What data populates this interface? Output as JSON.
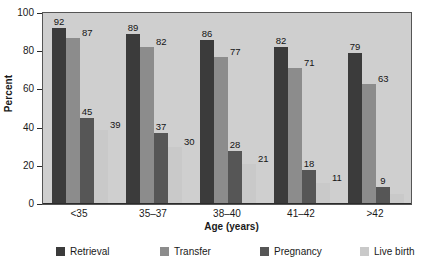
{
  "chart_data": {
    "type": "bar",
    "title": "",
    "xlabel": "Age (years)",
    "ylabel": "Percent",
    "categories": [
      "<35",
      "35–37",
      "38–40",
      "41–42",
      ">42"
    ],
    "ylim": [
      0,
      100
    ],
    "yticks": [
      0,
      20,
      40,
      60,
      80,
      100
    ],
    "grid": false,
    "legend_position": "bottom",
    "series": [
      {
        "name": "Retrieval",
        "color": "#3b3b3b",
        "values": [
          92,
          89,
          86,
          82,
          79
        ],
        "labels": [
          "92",
          "89",
          "86",
          "82",
          "79"
        ]
      },
      {
        "name": "Transfer",
        "color": "#8c8c8c",
        "values": [
          87,
          82,
          77,
          71,
          63
        ],
        "labels": [
          "87",
          "82",
          "77",
          "71",
          "63"
        ]
      },
      {
        "name": "Pregnancy",
        "color": "#565656",
        "values": [
          45,
          37,
          28,
          18,
          9
        ],
        "labels": [
          "45",
          "37",
          "28",
          "18",
          "9"
        ]
      },
      {
        "name": "Live birth",
        "color": "#c9c9c9",
        "values": [
          39,
          30,
          21,
          11,
          5
        ],
        "labels": [
          "39",
          "30",
          "21",
          "11",
          ""
        ]
      }
    ]
  },
  "axes": {
    "ylabel": "Percent",
    "xlabel": "Age (years)",
    "ytick_labels": [
      "100",
      "80",
      "60",
      "40",
      "20",
      "0"
    ],
    "xtick_labels": [
      "<35",
      "35–37",
      "38–40",
      "41–42",
      ">42"
    ]
  },
  "legend": {
    "items": [
      {
        "label": "Retrieval",
        "color": "#3b3b3b"
      },
      {
        "label": "Transfer",
        "color": "#8c8c8c"
      },
      {
        "label": "Pregnancy",
        "color": "#565656"
      },
      {
        "label": "Live birth",
        "color": "#c9c9c9"
      }
    ]
  },
  "colors": {
    "plot_background": "#cfcfcf",
    "page_background": "#ffffff",
    "axis": "#2b2b2b",
    "text": "#1a1a1a"
  }
}
